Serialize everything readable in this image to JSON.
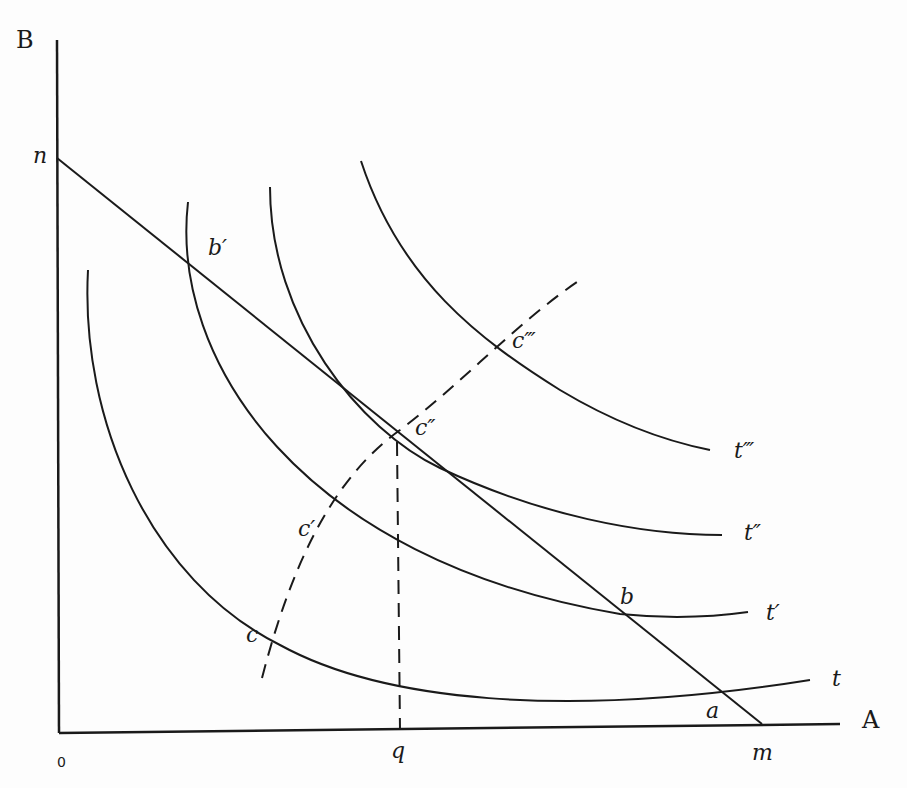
{
  "diagram": {
    "type": "indifference-curve diagram with budget line and income-consumption path",
    "axes": {
      "y_label": "B",
      "x_label": "A",
      "origin_label": "0"
    },
    "budget_line": {
      "y_intercept_label": "n",
      "x_intercept_label": "m"
    },
    "curves": [
      {
        "name": "t",
        "label": "t"
      },
      {
        "name": "t-prime",
        "label": "t′"
      },
      {
        "name": "t-double-prime",
        "label": "t″"
      },
      {
        "name": "t-triple-prime",
        "label": "t‴"
      }
    ],
    "points": {
      "a": "a",
      "b": "b",
      "b_prime": "b′",
      "c": "c",
      "c_prime": "c′",
      "c_double_prime": "c″",
      "c_triple_prime": "c‴"
    },
    "x_marker": "q",
    "caption": ""
  },
  "colors": {
    "ink": "#1a1a1a",
    "paper": "#fdfdfd"
  }
}
